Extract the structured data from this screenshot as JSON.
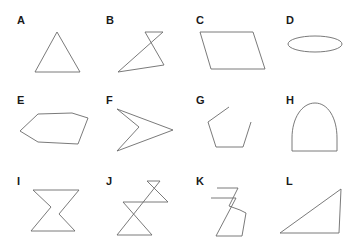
{
  "figure": {
    "stroke_color": "#6b6b6b",
    "label_color": "#1a1a1a",
    "background": "#ffffff",
    "panels": [
      {
        "label": "A",
        "shape": "triangle"
      },
      {
        "label": "B",
        "shape": "self-intersecting polygon"
      },
      {
        "label": "C",
        "shape": "parallelogram"
      },
      {
        "label": "D",
        "shape": "ellipse"
      },
      {
        "label": "E",
        "shape": "hexagon"
      },
      {
        "label": "F",
        "shape": "concave quadrilateral (arrowhead)"
      },
      {
        "label": "G",
        "shape": "open polyline (pentagon with gap)"
      },
      {
        "label": "H",
        "shape": "arch (curved top, straight base)"
      },
      {
        "label": "I",
        "shape": "concave hexagon (Z shape)"
      },
      {
        "label": "J",
        "shape": "self-intersecting polyline (hourglass with small triangle)"
      },
      {
        "label": "K",
        "shape": "self-intersecting open polyline"
      },
      {
        "label": "L",
        "shape": "right triangle"
      }
    ]
  }
}
